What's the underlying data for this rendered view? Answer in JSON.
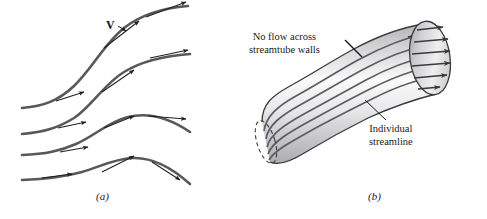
{
  "figure": {
    "kind": "textbook-figure",
    "background_color": "#ffffff",
    "panels": [
      {
        "id": "a",
        "caption": "(a)",
        "description": "Streamlines with tangent velocity vectors",
        "labels": [
          {
            "name": "velocity-vector-label",
            "text": "V",
            "bold": true
          }
        ]
      },
      {
        "id": "b",
        "caption": "(b)",
        "description": "Streamtube formed by a bundle of streamlines",
        "labels": [
          {
            "name": "no-flow-label",
            "line1": "No flow across",
            "line2": "streamtube walls"
          },
          {
            "name": "individual-streamline-label",
            "line1": "Individual",
            "line2": "streamline"
          }
        ]
      }
    ],
    "colors": {
      "streamline": "#58585c",
      "arrow": "#1f1f22",
      "tube_outline": "#3b3b3f",
      "tube_fill_light": "#fbfbfb",
      "tube_fill_mid": "#d8d8d8",
      "tube_fill_dark": "#a9a9ad",
      "cap_fill_light": "#f2f2f2",
      "cap_fill_dark": "#9e9ea2",
      "text": "#1a1a1a"
    }
  },
  "panel_a": {
    "caption": "(a)",
    "vector_label": "V",
    "streamline_count": 4,
    "arrow_count": 8
  },
  "panel_b": {
    "caption": "(b)",
    "no_flow_line1": "No flow across",
    "no_flow_line2": "streamtube walls",
    "individual_line1": "Individual",
    "individual_line2": "streamline",
    "interior_streamline_count": 5,
    "outlet_arrow_count": 6
  }
}
